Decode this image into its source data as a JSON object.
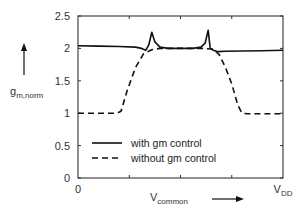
{
  "chart_data": {
    "type": "line",
    "title": "",
    "xlabel": "V",
    "xlabel_sub": "common",
    "ylabel": "g",
    "ylabel_sub": "m,norm",
    "xlim": [
      0,
      1
    ],
    "ylim": [
      0,
      2.5
    ],
    "x_tick_labels": [
      {
        "x": 0,
        "label": "0"
      },
      {
        "x": 1,
        "label": "V",
        "sub": "DD"
      }
    ],
    "x_minor_ticks": [
      0.25,
      0.5,
      0.75
    ],
    "y_ticks": [
      0,
      0.5,
      1,
      1.5,
      2,
      2.5
    ],
    "y_tick_labels": [
      "0",
      "0.5",
      "1",
      "1.5",
      "2",
      "2.5"
    ],
    "grid": false,
    "legend_position": "lower-left",
    "series": [
      {
        "name": "with gm control",
        "style": "solid",
        "x": [
          0,
          0.1,
          0.2,
          0.28,
          0.31,
          0.33,
          0.345,
          0.36,
          0.375,
          0.4,
          0.44,
          0.5,
          0.56,
          0.6,
          0.62,
          0.635,
          0.645,
          0.66,
          0.68,
          0.72,
          0.8,
          0.9,
          1.0
        ],
        "y": [
          2.04,
          2.035,
          2.03,
          2.02,
          2.0,
          1.97,
          2.05,
          2.25,
          2.1,
          2.02,
          2.0,
          2.0,
          2.0,
          2.02,
          2.08,
          2.28,
          2.0,
          1.97,
          1.95,
          1.955,
          1.96,
          1.965,
          1.97
        ]
      },
      {
        "name": "without gm control",
        "style": "dashed",
        "x": [
          0,
          0.1,
          0.19,
          0.21,
          0.24,
          0.28,
          0.32,
          0.36,
          0.4,
          0.5,
          0.6,
          0.66,
          0.69,
          0.72,
          0.75,
          0.78,
          0.8,
          0.83,
          0.9,
          1.0
        ],
        "y": [
          1.0,
          1.0,
          1.0,
          1.03,
          1.35,
          1.7,
          1.92,
          1.98,
          2.0,
          2.0,
          2.0,
          1.99,
          1.9,
          1.7,
          1.45,
          1.12,
          1.0,
          0.99,
          0.99,
          0.99
        ]
      }
    ]
  }
}
